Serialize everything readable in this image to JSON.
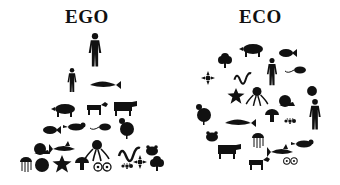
{
  "left_panel": {
    "title": "EGO",
    "layout": "pyramid",
    "rows": [
      [
        "human"
      ],
      [
        "human-small",
        "whale"
      ],
      [
        "pig",
        "dog",
        "cow"
      ],
      [
        "fish",
        "bird",
        "rat",
        "chicken"
      ],
      [
        "snail",
        "shark",
        "octopus",
        "snake",
        "frog"
      ],
      [
        "jellyfish",
        "sphere",
        "starfish",
        "mushroom",
        "cells",
        "ant",
        "flower",
        "coral"
      ]
    ]
  },
  "right_panel": {
    "title": "ECO",
    "layout": "circle",
    "items": [
      "pig",
      "coral",
      "fish",
      "flower",
      "snake",
      "human",
      "rat",
      "starfish",
      "octopus",
      "snail",
      "sphere",
      "chicken",
      "whale",
      "mushroom",
      "ant",
      "human",
      "frog",
      "jellyfish",
      "bird",
      "cow",
      "shark",
      "dog",
      "cells"
    ]
  },
  "colors": {
    "silhouette": "#111111",
    "background": "#ffffff"
  }
}
